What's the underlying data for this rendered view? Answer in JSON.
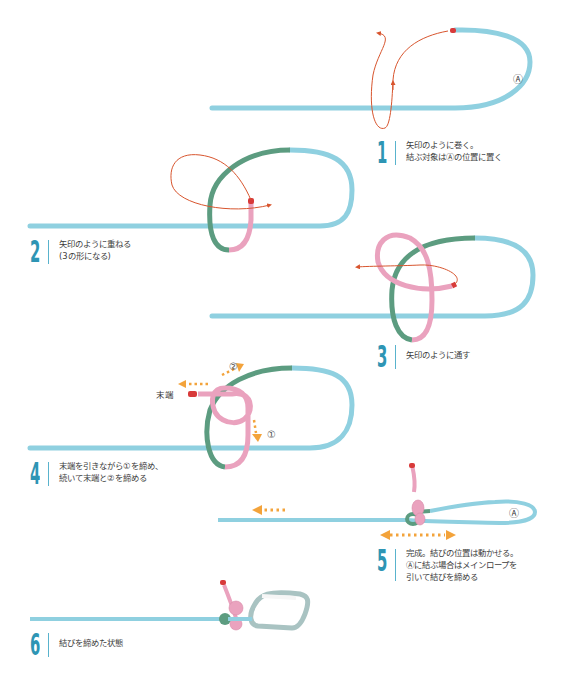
{
  "colors": {
    "rope_main": "#8fd0e0",
    "rope_green": "#5c9c80",
    "rope_pink": "#eaa2be",
    "rope_end": "#d83a3a",
    "arrow_red": "#d8552e",
    "arrow_orange": "#f3a33b",
    "step_number": "#2e95b4",
    "carabiner": "#a9c3c2"
  },
  "steps": [
    {
      "number": "1",
      "lines": [
        "矢印のように巻く。",
        "結ぶ対象はⒶの位置に置く"
      ]
    },
    {
      "number": "2",
      "lines": [
        "矢印のように重ねる",
        "(3の形になる)"
      ],
      "highlight": "3"
    },
    {
      "number": "3",
      "lines": [
        "矢印のように通す"
      ]
    },
    {
      "number": "4",
      "lines": [
        "末端を引きながら①を締め、",
        "続いて末端と②を締める"
      ]
    },
    {
      "number": "5",
      "lines": [
        "完成。結びの位置は動かせる。",
        "Ⓐに結ぶ場合はメインロープを",
        "引いて結びを締める"
      ]
    },
    {
      "number": "6",
      "lines": [
        "結びを締めた状態"
      ]
    }
  ],
  "labels": {
    "point_a": "Ⓐ",
    "circled_1": "①",
    "circled_2": "②",
    "rope_end": "末端"
  }
}
